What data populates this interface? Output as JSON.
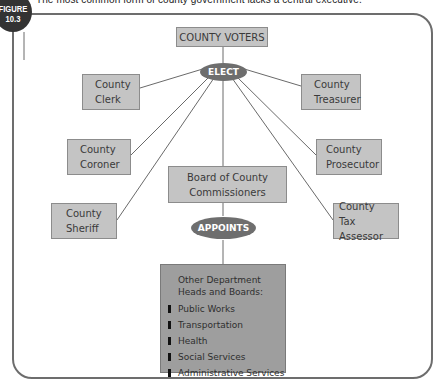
{
  "figure": {
    "badge_line1": "FIGURE",
    "badge_line2": "10.3",
    "caption": "The most common form of county government lacks a central executive."
  },
  "diagram": {
    "voters": "COUNTY VOTERS",
    "elect": "ELECT",
    "elected_offices": [
      {
        "line1": "County",
        "line2": "Clerk"
      },
      {
        "line1": "County",
        "line2": "Treasurer"
      },
      {
        "line1": "County",
        "line2": "Coroner"
      },
      {
        "line1": "County",
        "line2": "Prosecutor"
      },
      {
        "line1": "County",
        "line2": "Sheriff"
      },
      {
        "line1": "County",
        "line2": "Tax Assessor"
      }
    ],
    "board": {
      "line1": "Board of County",
      "line2": "Commissioners"
    },
    "appoints": "APPOINTS",
    "departments": {
      "title_line1": "Other Department",
      "title_line2": "Heads and Boards:",
      "items": [
        "Public Works",
        "Transportation",
        "Health",
        "Social Services",
        "Administrative Services"
      ]
    }
  },
  "colors": {
    "box_fill": "#c4c4c4",
    "oval_fill": "#6e6e6e",
    "dept_fill": "#9e9e9e",
    "frame": "#6d6d6d",
    "badge": "#333333"
  }
}
